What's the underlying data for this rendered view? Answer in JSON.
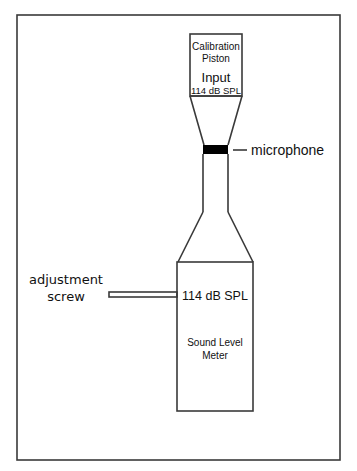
{
  "diagram": {
    "piston": {
      "line1": "Calibration",
      "line2": "Piston",
      "input_label": "Input",
      "input_level": "114 dB SPL"
    },
    "microphone_label": "microphone",
    "adjustment_label_line1": "adjustment",
    "adjustment_label_line2": "screw",
    "meter": {
      "reading": "114 dB SPL",
      "line1": "Sound Level",
      "line2": "Meter"
    },
    "colors": {
      "stroke": "#3a3a3a",
      "microphone_fill": "#000000",
      "background": "#ffffff"
    }
  }
}
